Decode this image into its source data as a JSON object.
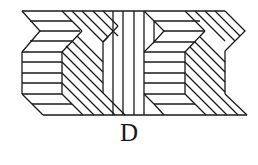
{
  "figure": {
    "option_label": "D",
    "stroke_color": "#1a1a1a",
    "background": "#ffffff"
  }
}
